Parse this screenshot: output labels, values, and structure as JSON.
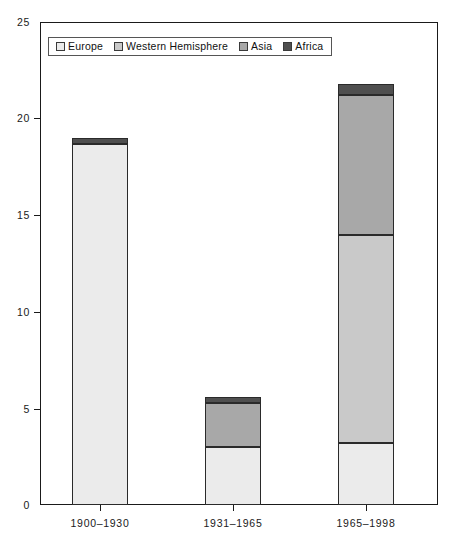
{
  "chart_data": {
    "type": "bar",
    "subtype": "stacked-bar",
    "title": "",
    "xlabel": "",
    "ylabel": "",
    "ylim": [
      0,
      25
    ],
    "yticks": [
      0,
      5,
      10,
      15,
      20,
      25
    ],
    "grid": false,
    "legend_position": "top-left-inside",
    "categories": [
      "1900–1930",
      "1931–1965",
      "1965–1998"
    ],
    "series": [
      {
        "name": "Europe",
        "color": "#ebebeb",
        "values": [
          18.7,
          3.0,
          3.2
        ]
      },
      {
        "name": "Western Hemisphere",
        "color": "#c9c9c9",
        "values": [
          0.0,
          0.0,
          10.8
        ]
      },
      {
        "name": "Asia",
        "color": "#a8a8a8",
        "values": [
          0.0,
          2.3,
          7.2
        ]
      },
      {
        "name": "Africa",
        "color": "#4f4f4f",
        "values": [
          0.3,
          0.3,
          0.6
        ]
      }
    ],
    "totals": [
      19.0,
      5.6,
      21.8
    ]
  },
  "axes": {
    "y_tick_labels": [
      "0",
      "5",
      "10",
      "15",
      "20",
      "25"
    ],
    "x_tick_labels": [
      "1900–1930",
      "1931–1965",
      "1965–1998"
    ]
  },
  "legend": {
    "entries": [
      {
        "label": "Europe",
        "swatch": "#ebebeb"
      },
      {
        "label": "Western Hemisphere",
        "swatch": "#c9c9c9"
      },
      {
        "label": "Asia",
        "swatch": "#a8a8a8"
      },
      {
        "label": "Africa",
        "swatch": "#4f4f4f"
      }
    ]
  },
  "colors": {
    "axis": "#1a1a1a",
    "bar_outline": "#2a2a2a",
    "background": "#ffffff"
  }
}
